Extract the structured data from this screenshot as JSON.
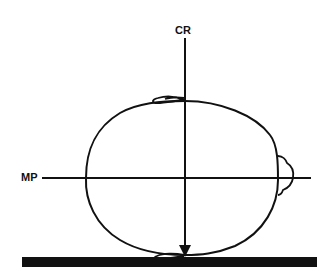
{
  "diagram": {
    "labels": {
      "central_ray": "CR",
      "midsagittal_plane": "MP"
    },
    "colors": {
      "ink": "#111111",
      "background": "#ffffff"
    },
    "elements": [
      "skull-outline",
      "central-ray-arrow",
      "midsagittal-plane-line",
      "image-receptor-bar",
      "nose-top",
      "nose-bottom",
      "ear-right"
    ]
  }
}
